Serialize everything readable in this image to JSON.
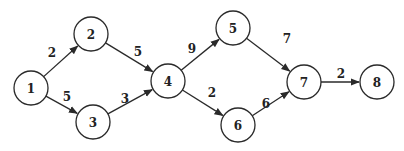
{
  "diagram": {
    "type": "directed-weighted-graph",
    "colors": {
      "stroke": "#2a2a2a",
      "fill": "#ffffff",
      "text": "#222222"
    },
    "node_radius": 17,
    "nodes": [
      {
        "id": "1",
        "label": "1",
        "x": 31,
        "y": 88
      },
      {
        "id": "2",
        "label": "2",
        "x": 91,
        "y": 34
      },
      {
        "id": "3",
        "label": "3",
        "x": 93,
        "y": 122
      },
      {
        "id": "4",
        "label": "4",
        "x": 168,
        "y": 81
      },
      {
        "id": "5",
        "label": "5",
        "x": 233,
        "y": 28
      },
      {
        "id": "6",
        "label": "6",
        "x": 238,
        "y": 125
      },
      {
        "id": "7",
        "label": "7",
        "x": 304,
        "y": 82
      },
      {
        "id": "8",
        "label": "8",
        "x": 377,
        "y": 82
      }
    ],
    "edges": [
      {
        "from": "1",
        "to": "2",
        "weight": "2",
        "lx": 52,
        "ly": 53
      },
      {
        "from": "1",
        "to": "3",
        "weight": "5",
        "lx": 67,
        "ly": 97
      },
      {
        "from": "2",
        "to": "4",
        "weight": "5",
        "lx": 138,
        "ly": 52
      },
      {
        "from": "3",
        "to": "4",
        "weight": "3",
        "lx": 125,
        "ly": 99
      },
      {
        "from": "4",
        "to": "5",
        "weight": "9",
        "lx": 192,
        "ly": 49
      },
      {
        "from": "4",
        "to": "6",
        "weight": "2",
        "lx": 212,
        "ly": 93
      },
      {
        "from": "5",
        "to": "7",
        "weight": "7",
        "lx": 287,
        "ly": 39
      },
      {
        "from": "6",
        "to": "7",
        "weight": "6",
        "lx": 266,
        "ly": 104
      },
      {
        "from": "7",
        "to": "8",
        "weight": "2",
        "lx": 341,
        "ly": 74
      }
    ]
  }
}
